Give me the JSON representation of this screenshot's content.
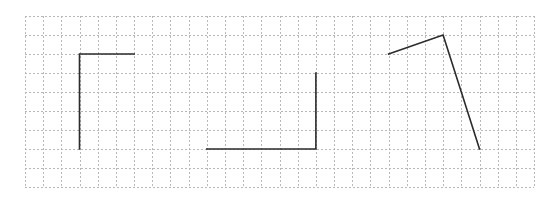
{
  "figure": {
    "type": "grid-diagram",
    "grid": {
      "origin_px": [
        25,
        16
      ],
      "columns": 28,
      "rows": 9,
      "cell_width_px": 18.18,
      "cell_height_px": 19,
      "line_color": "#b8b8b8",
      "line_style": "dotted"
    },
    "stroke_color": "#2b2b2b",
    "shapes": [
      {
        "name": "angle-1",
        "kind": "right-angle",
        "points_grid": [
          [
            6,
            2
          ],
          [
            3,
            2
          ],
          [
            3,
            7
          ]
        ]
      },
      {
        "name": "angle-2",
        "kind": "right-angle",
        "points_grid": [
          [
            10,
            7
          ],
          [
            16,
            7
          ],
          [
            16,
            3
          ]
        ]
      },
      {
        "name": "angle-3",
        "kind": "acute-angle",
        "points_grid": [
          [
            20,
            2
          ],
          [
            23,
            1
          ],
          [
            25,
            7
          ]
        ]
      }
    ]
  }
}
